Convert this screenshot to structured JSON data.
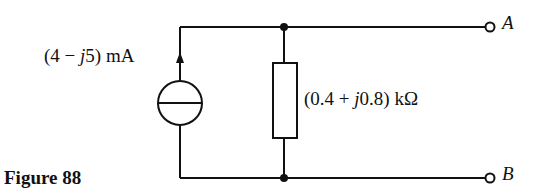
{
  "figure": {
    "caption": "Figure 88"
  },
  "circuit": {
    "current_source": {
      "label_prefix": "(4 − ",
      "label_j": "j",
      "label_suffix": "5) mA",
      "direction": "up"
    },
    "impedance": {
      "label_prefix": "(0.4 + ",
      "label_j": "j",
      "label_suffix": "0.8) kΩ"
    },
    "terminals": [
      {
        "name": "A"
      },
      {
        "name": "B"
      }
    ]
  },
  "colors": {
    "line": "#111111",
    "background": "#ffffff"
  }
}
